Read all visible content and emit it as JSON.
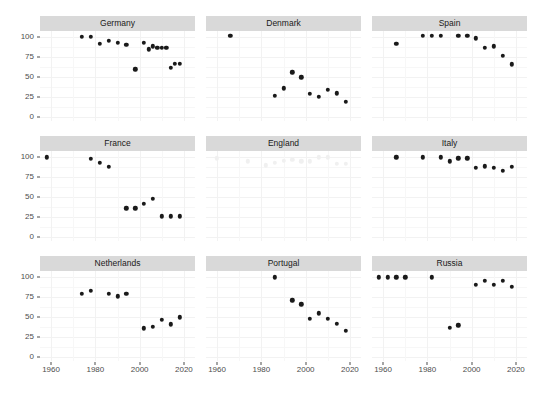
{
  "chart_data": {
    "type": "scatter",
    "title": "",
    "subtitle": "",
    "xlabel": "",
    "ylabel": "",
    "xlim": [
      1955,
      2025
    ],
    "ylim": [
      -5,
      108
    ],
    "x_ticks": [
      1960,
      1980,
      2000,
      2020
    ],
    "y_ticks": [
      0,
      25,
      50,
      75,
      100
    ],
    "grid": true,
    "legend": "none",
    "facet_layout": {
      "rows": 3,
      "cols": 3
    },
    "point_color": "#1a1a1a",
    "faded_point_color": "#f0f0f0",
    "strip_background": "#d9d9d9",
    "panel_grid_color": "#f2f2f2",
    "facets": [
      {
        "label": "Germany",
        "faded": false,
        "x": [
          1974,
          1978,
          1982,
          1986,
          1990,
          1994,
          1998,
          2002,
          2004,
          2006,
          2008,
          2010,
          2012,
          2014,
          2016,
          2018
        ],
        "y": [
          101,
          101,
          92,
          96,
          93,
          91,
          60,
          93,
          85,
          89,
          87,
          87,
          87,
          62,
          67,
          67
        ]
      },
      {
        "label": "Denmark",
        "faded": false,
        "x": [
          1966,
          1986,
          1990,
          1994,
          1998,
          2002,
          2006,
          2010,
          2014,
          2018
        ],
        "y": [
          102,
          27,
          36,
          56,
          50,
          29,
          25,
          34,
          30,
          19
        ]
      },
      {
        "label": "Spain",
        "faded": false,
        "x": [
          1966,
          1978,
          1982,
          1986,
          1994,
          1998,
          2002,
          2006,
          2010,
          2014,
          2018
        ],
        "y": [
          92,
          102,
          102,
          102,
          102,
          102,
          99,
          87,
          89,
          77,
          66
        ]
      },
      {
        "label": "France",
        "faded": false,
        "x": [
          1958,
          1978,
          1982,
          1986,
          1994,
          1998,
          2002,
          2006,
          2010,
          2014,
          2018
        ],
        "y": [
          100,
          98,
          93,
          88,
          36,
          36,
          42,
          48,
          26,
          26,
          26
        ]
      },
      {
        "label": "England",
        "faded": true,
        "x": [
          1960,
          1974,
          1982,
          1986,
          1990,
          1994,
          1998,
          2002,
          2006,
          2010,
          2014,
          2018
        ],
        "y": [
          99,
          95,
          90,
          93,
          96,
          97,
          95,
          95,
          100,
          100,
          92,
          92
        ]
      },
      {
        "label": "Italy",
        "faded": false,
        "x": [
          1966,
          1978,
          1986,
          1990,
          1994,
          1998,
          2002,
          2006,
          2010,
          2014,
          2018
        ],
        "y": [
          100,
          100,
          100,
          95,
          99,
          99,
          87,
          89,
          87,
          83,
          88
        ]
      },
      {
        "label": "Netherlands",
        "faded": false,
        "x": [
          1974,
          1978,
          1986,
          1990,
          1994,
          2002,
          2006,
          2010,
          2014,
          2018
        ],
        "y": [
          79,
          83,
          79,
          76,
          79,
          36,
          38,
          47,
          41,
          50
        ]
      },
      {
        "label": "Portugal",
        "faded": false,
        "x": [
          1986,
          1994,
          1998,
          2002,
          2006,
          2010,
          2014,
          2018
        ],
        "y": [
          100,
          71,
          66,
          48,
          55,
          48,
          42,
          33
        ]
      },
      {
        "label": "Russia",
        "faded": false,
        "x": [
          1958,
          1962,
          1966,
          1970,
          1982,
          1990,
          1994,
          2002,
          2006,
          2010,
          2014,
          2018
        ],
        "y": [
          100,
          100,
          100,
          100,
          100,
          37,
          40,
          91,
          96,
          91,
          96,
          88
        ]
      }
    ]
  },
  "axis": {
    "y_tick_labels": [
      "100",
      "75",
      "50",
      "25",
      "0"
    ],
    "x_tick_labels": [
      "1960",
      "1980",
      "2000",
      "2020"
    ]
  }
}
